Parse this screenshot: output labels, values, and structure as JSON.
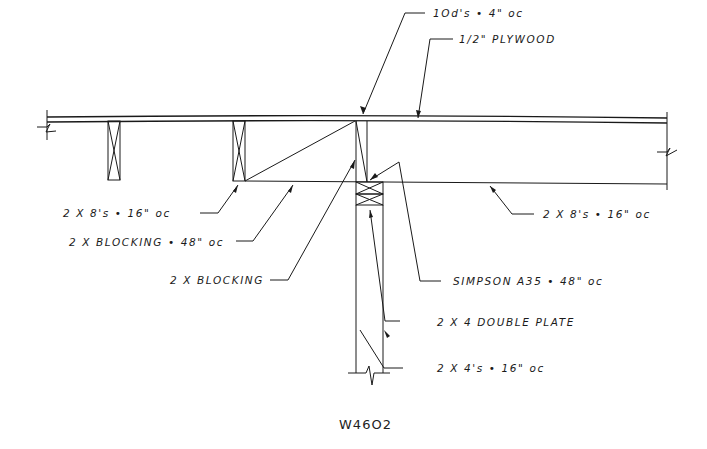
{
  "drawing": {
    "title": "W46O2",
    "line_color": "#1a1a1a",
    "background": "#ffffff"
  },
  "callouts": {
    "nailing": "1Od's • 4\" oc",
    "sheathing": "1/2\" PLYWOOD",
    "joists_left": "2 X 8's • 16\" oc",
    "blocking_48": "2 X BLOCKING • 48\" oc",
    "blocking": "2 X BLOCKING",
    "joists_right": "2 X 8's • 16\" oc",
    "connector": "SIMPSON A35 • 48\" oc",
    "double_plate": "2 X 4 DOUBLE PLATE",
    "studs": "2 X 4's • 16\" oc"
  }
}
